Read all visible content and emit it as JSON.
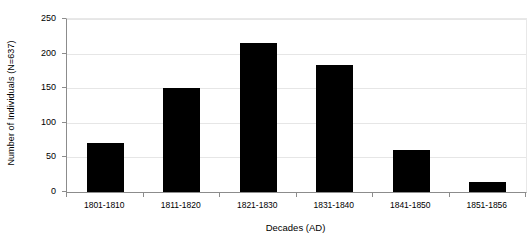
{
  "chart_data": {
    "type": "bar",
    "title": "",
    "xlabel": "Decades (AD)",
    "ylabel": "Number of Individuals (N=637)",
    "categories": [
      "1801-1810",
      "1811-1820",
      "1821-1830",
      "1831-1840",
      "1841-1850",
      "1851-1856"
    ],
    "values": [
      71,
      151,
      215,
      183,
      60,
      14
    ],
    "ylim": [
      0,
      250
    ],
    "yticks": [
      0,
      50,
      100,
      150,
      200,
      250
    ],
    "ytick_labels": [
      "0",
      "50",
      "100",
      "150",
      "200",
      "250"
    ],
    "grid": true,
    "legend": false,
    "legend_position": "none",
    "bar_color": "#000000",
    "gridline_color": "#E6E6E6",
    "axis_color": "#8C8C8C",
    "background_color": "#FFFFFF"
  }
}
